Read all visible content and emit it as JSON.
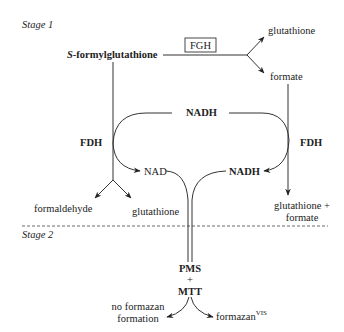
{
  "diagram": {
    "stage1_label": "Stage 1",
    "stage2_label": "Stage 2",
    "substrate": {
      "prefix": "S",
      "rest": "-formylglutathione"
    },
    "enzyme_fgh": "FGH",
    "fgh_products": {
      "glutathione": "glutathione",
      "formate": "formate"
    },
    "fdh_left": "FDH",
    "fdh_right": "FDH",
    "nadh_top": "NADH",
    "nad_left": "NAD",
    "nadh_right": "NADH",
    "fdh_left_products": {
      "formaldehyde": "formaldehyde",
      "glutathione": "glutathione"
    },
    "fdh_right_products": {
      "line1": "glutathione +",
      "line2": "formate"
    },
    "pms": "PMS",
    "plus": "+",
    "mtt": "MTT",
    "no_formazan": {
      "line1": "no formazan",
      "line2": "formation"
    },
    "formazan": {
      "base": "formazan",
      "sup": "VIS"
    }
  }
}
